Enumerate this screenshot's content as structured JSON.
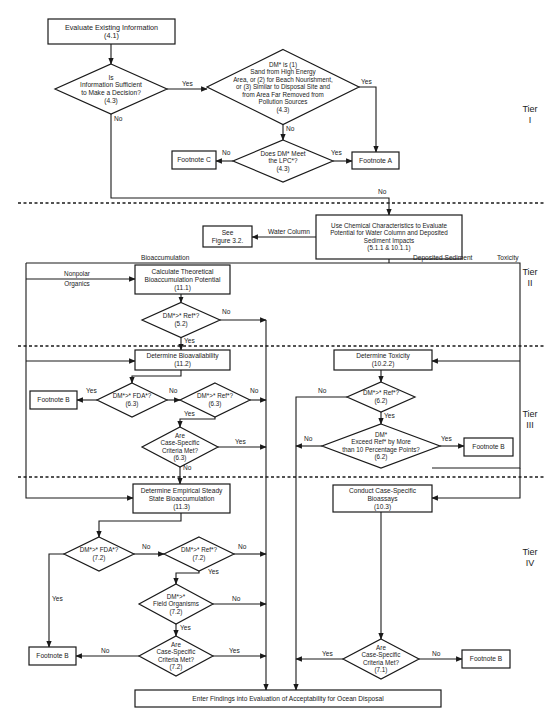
{
  "tiers": [
    "Tier I",
    "Tier II",
    "Tier III",
    "Tier IV"
  ],
  "nodes": {
    "evaluate_existing": {
      "lines": [
        "Evaluate Existing Information",
        "(4.1)"
      ]
    },
    "info_sufficient": {
      "lines": [
        "Is",
        "Information Sufficient",
        "to Make a Decision?",
        "(4.3)"
      ]
    },
    "dm_is_sand": {
      "lines": [
        "DM* is (1)",
        "Sand from High Energy",
        "Area, or (2) for Beach Nourishment,",
        "or (3) Similar to Disposal Site and",
        "from Area Far Removed from",
        "Pollution Sources",
        "(4.3)"
      ]
    },
    "dm_meet_lpc": {
      "lines": [
        "Does DM* Meet",
        "the LPC*?",
        "(4.3)"
      ]
    },
    "footnote_c": {
      "lines": [
        "Footnote C"
      ]
    },
    "footnote_a": {
      "lines": [
        "Footnote A"
      ]
    },
    "use_chemical": {
      "lines": [
        "Use Chemical Characteristics to Evaluate",
        "Potential for Water Column and Deposited",
        "Sediment Impacts",
        "(5.1.1 & 10.1.1)"
      ]
    },
    "see_figure": {
      "lines": [
        "See",
        "Figure 3.2."
      ]
    },
    "calc_theoretical": {
      "lines": [
        "Calculate Theoretical",
        "Bioaccumulation Potential",
        "(11.1)"
      ]
    },
    "dm_ref_52": {
      "lines": [
        "DM*>* Ref*?",
        "(5.2)"
      ]
    },
    "determine_bioavail": {
      "lines": [
        "Determine Bioavailability",
        "(11.2)"
      ]
    },
    "dm_fda_63": {
      "lines": [
        "DM*>* FDA*?",
        "(6.3)"
      ]
    },
    "dm_ref_63": {
      "lines": [
        "DM*>* Ref*?",
        "(6.3)"
      ]
    },
    "footnote_b1": {
      "lines": [
        "Footnote B"
      ]
    },
    "case_63": {
      "lines": [
        "Are",
        "Case-Specific",
        "Criteria Met?",
        "(6.3)"
      ]
    },
    "determine_toxicity": {
      "lines": [
        "Determine Toxicity",
        "(10.2.2)"
      ]
    },
    "dm_ref_62": {
      "lines": [
        "DM*>* Ref*?",
        "(6.2)"
      ]
    },
    "dm_exceed_62": {
      "lines": [
        "DM*",
        "Exceed Ref* by More",
        "than 10 Percentage Points?",
        "(6.2)"
      ]
    },
    "footnote_b2": {
      "lines": [
        "Footnote B"
      ]
    },
    "empirical_ss": {
      "lines": [
        "Determine Empirical Steady",
        "State Bioaccumulation",
        "(11.3)"
      ]
    },
    "case_bioassays": {
      "lines": [
        "Conduct Case-Specific",
        "Bioassays",
        "(10.3)"
      ]
    },
    "dm_fda_72": {
      "lines": [
        "DM*>* FDA*?",
        "(7.2)"
      ]
    },
    "dm_ref_72": {
      "lines": [
        "DM*>* Ref*?",
        "(7.2)"
      ]
    },
    "dm_field_72": {
      "lines": [
        "DM*>*",
        "Field Organisms",
        "(7.2)"
      ]
    },
    "case_72": {
      "lines": [
        "Are",
        "Case-Specific",
        "Criteria Met?",
        "(7.2)"
      ]
    },
    "footnote_b3": {
      "lines": [
        "Footnote B"
      ]
    },
    "case_71": {
      "lines": [
        "Are",
        "Case-Specific",
        "Criteria Met?",
        "(7.1)"
      ]
    },
    "footnote_b4": {
      "lines": [
        "Footnote B"
      ]
    },
    "enter_findings": {
      "lines": [
        "Enter Findings into Evaluation of Acceptability for Ocean Disposal"
      ]
    }
  },
  "edge_labels": {
    "yes": "Yes",
    "no": "No",
    "water_column": "Water Column",
    "bioaccumulation": "Bioaccumulation",
    "deposited_sediment": "Deposited Sediment",
    "toxicity": "Toxicity",
    "nonpolar_organics": [
      "Nonpolar",
      "Organics"
    ]
  }
}
